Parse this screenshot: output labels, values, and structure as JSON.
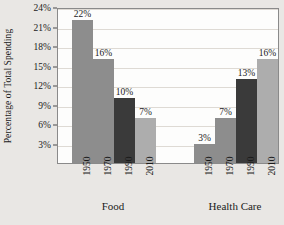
{
  "chart_data": {
    "type": "bar",
    "title": "",
    "xlabel": "",
    "ylabel": "Percentage of Total Spending",
    "ylim": [
      0,
      24
    ],
    "ytick_values": [
      3,
      6,
      9,
      12,
      15,
      18,
      21,
      24
    ],
    "ytick_labels": [
      "3%",
      "6%",
      "9%",
      "12%",
      "15%",
      "18%",
      "21%",
      "24%"
    ],
    "grid": true,
    "legend": "none",
    "categories": [
      "1950",
      "1970",
      "1990",
      "2010"
    ],
    "groups": [
      {
        "name": "Food",
        "label": "Food",
        "values": [
          22,
          16,
          10,
          7
        ],
        "value_labels": [
          "22%",
          "16%",
          "10%",
          "7%"
        ]
      },
      {
        "name": "Health Care",
        "label": "Health Care",
        "values": [
          3,
          7,
          13,
          16
        ],
        "value_labels": [
          "3%",
          "7%",
          "13%",
          "16%"
        ]
      }
    ],
    "bar_colors": [
      "#8d8d8d",
      "#8d8d8d",
      "#3a3a3a",
      "#adadad"
    ],
    "colors": {
      "background": "#e9e7e4",
      "plot_background": "#fdfdfc",
      "axis": "#8a8a8a",
      "gridline": "#dedad4",
      "text": "#1b1b1b"
    }
  }
}
